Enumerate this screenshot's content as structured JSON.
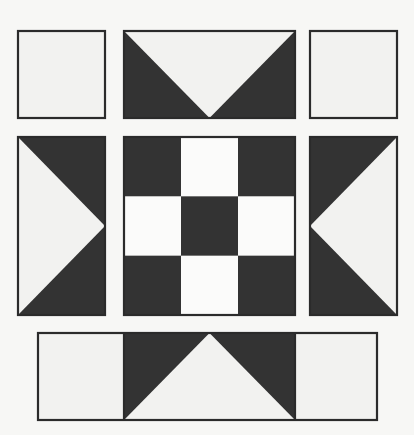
{
  "artwork": {
    "title": "Quilt Block Pattern",
    "kind": "patchwork-quilt-block",
    "canvas": {
      "width": 414,
      "height": 435
    },
    "colors": {
      "background": "#f7f7f5",
      "dark": "#333333",
      "light": "#f2f2f0",
      "light_bright": "#fbfbfa",
      "outline": "#2b2b2b"
    },
    "grid": {
      "rows": 3,
      "columns": 3,
      "description": "Three-row sashed quilt block: corner squares, flying-geese units and a nine-patch centre."
    }
  },
  "units": [
    {
      "id": "top-left-square",
      "name": "plain-square",
      "row": "top",
      "column": "left",
      "shape": "square",
      "fill": "light",
      "x": 18,
      "y": 31,
      "width": 87,
      "height": 87
    },
    {
      "id": "top-center-geese",
      "name": "flying-geese-down",
      "row": "top",
      "column": "center",
      "shape": "flying-geese",
      "direction": "down",
      "background": "dark",
      "triangle_fill": "light",
      "x": 124,
      "y": 31,
      "width": 171,
      "height": 87,
      "triangle_points": "124,31 295,31 209.5,118"
    },
    {
      "id": "top-right-square",
      "name": "plain-square",
      "row": "top",
      "column": "right",
      "shape": "square",
      "fill": "light",
      "x": 310,
      "y": 31,
      "width": 87,
      "height": 87
    },
    {
      "id": "middle-left-geese",
      "name": "flying-geese-right",
      "row": "middle",
      "column": "left",
      "shape": "flying-geese",
      "direction": "right",
      "background": "dark",
      "triangle_fill": "light",
      "x": 18,
      "y": 137,
      "width": 87,
      "height": 178,
      "triangle_points": "18,137 105,226 18,315"
    },
    {
      "id": "center-nine-patch",
      "name": "nine-patch-checkerboard",
      "row": "middle",
      "column": "center",
      "shape": "checkerboard",
      "x": 124,
      "y": 137,
      "width": 171,
      "height": 178,
      "rows": 3,
      "columns": 3,
      "cells": [
        [
          "dark",
          "light",
          "dark"
        ],
        [
          "light",
          "dark",
          "light"
        ],
        [
          "dark",
          "light",
          "dark"
        ]
      ]
    },
    {
      "id": "middle-right-geese",
      "name": "flying-geese-left",
      "row": "middle",
      "column": "right",
      "shape": "flying-geese",
      "direction": "left",
      "background": "dark",
      "triangle_fill": "light",
      "x": 310,
      "y": 137,
      "width": 87,
      "height": 178,
      "triangle_points": "397,137 310,226 397,315"
    },
    {
      "id": "bottom-bar",
      "name": "bottom-sash-bar",
      "row": "bottom",
      "column": "full-width",
      "shape": "three-part-bar",
      "x": 38,
      "y": 333,
      "width": 339,
      "height": 87,
      "segments": [
        {
          "id": "bottom-left-square",
          "name": "plain-square",
          "fill": "light",
          "x": 38,
          "y": 333,
          "width": 86,
          "height": 87
        },
        {
          "id": "bottom-center-geese",
          "name": "flying-geese-up",
          "direction": "up",
          "background": "dark",
          "triangle_fill": "light",
          "x": 124,
          "y": 333,
          "width": 171,
          "height": 87,
          "triangle_points": "124,420 295,420 209.5,333"
        },
        {
          "id": "bottom-right-square",
          "name": "plain-square",
          "fill": "light",
          "x": 295,
          "y": 333,
          "width": 82,
          "height": 87
        }
      ]
    }
  ],
  "legend": {
    "dark_label": "Dark fabric",
    "light_label": "Light fabric"
  }
}
